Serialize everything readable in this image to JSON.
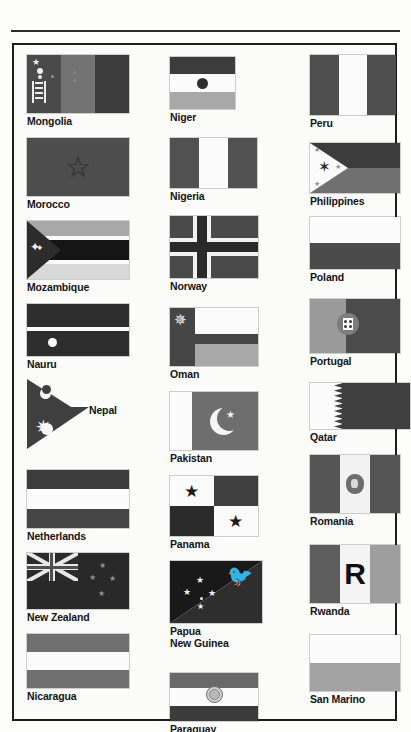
{
  "page": {
    "section": "Mongolia – San Marino",
    "layout": "three-column flag reference plate",
    "background_color": "#fdfdfc",
    "border_color": "#1c1c1c",
    "caption_color": "#141414"
  },
  "columns": [
    {
      "name": "column-1",
      "entries": [
        {
          "country": "Mongolia",
          "caption_position": "below"
        },
        {
          "country": "Morocco",
          "caption_position": "below"
        },
        {
          "country": "Mozambique",
          "caption_position": "below"
        },
        {
          "country": "Nauru",
          "caption_position": "below"
        },
        {
          "country": "Nepal",
          "caption_position": "inline-right"
        },
        {
          "country": "Netherlands",
          "caption_position": "below"
        },
        {
          "country": "New Zealand",
          "caption_position": "below"
        },
        {
          "country": "Nicaragua",
          "caption_position": "below"
        }
      ]
    },
    {
      "name": "column-2",
      "entries": [
        {
          "country": "Niger",
          "caption_position": "below"
        },
        {
          "country": "Nigeria",
          "caption_position": "below"
        },
        {
          "country": "Norway",
          "caption_position": "below"
        },
        {
          "country": "Oman",
          "caption_position": "below"
        },
        {
          "country": "Pakistan",
          "caption_position": "below"
        },
        {
          "country": "Panama",
          "caption_position": "below"
        },
        {
          "country": "Papua\nNew Guinea",
          "caption_position": "below"
        },
        {
          "country": "Paraguay",
          "caption_position": "below"
        }
      ]
    },
    {
      "name": "column-3",
      "entries": [
        {
          "country": "Peru",
          "caption_position": "below"
        },
        {
          "country": "Philippines",
          "caption_position": "below"
        },
        {
          "country": "Poland",
          "caption_position": "below"
        },
        {
          "country": "Portugal",
          "caption_position": "below"
        },
        {
          "country": "Qatar",
          "caption_position": "below"
        },
        {
          "country": "Romania",
          "caption_position": "below"
        },
        {
          "country": "Rwanda",
          "caption_position": "below"
        },
        {
          "country": "San Marino",
          "caption_position": "below"
        }
      ]
    }
  ],
  "flag_marks": {
    "rwanda_letter": "R",
    "nepal_symbols": "moon and sun",
    "oman_symbol": "khanjar dagger",
    "philippines_symbol": "sun and three stars",
    "papua_symbol": "bird of paradise and Southern Cross",
    "pakistan_symbol": "crescent and star",
    "niger_symbol": "orange disc",
    "nauru_symbol": "white star",
    "paraguay_symbol": "national coat of arms",
    "romania_symbol": "socialist coat of arms",
    "portugal_symbol": "armillary sphere and shield",
    "morocco_symbol": "interlaced pentagram",
    "mongolia_symbol": "soyombo",
    "panama_symbols": "two stars",
    "qatar_symbol": "nine-point serrated band",
    "new_zealand_symbols": "Union Jack and Southern Cross"
  }
}
